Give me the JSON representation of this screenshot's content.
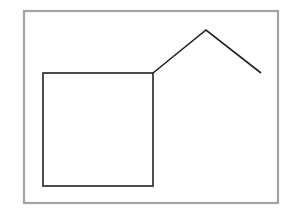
{
  "canvas": {
    "width": 292,
    "height": 215,
    "background_color": "#ffffff",
    "description": "Simple line drawing of a house: a square body with a peaked roof line extending to the upper right, enclosed in a thin gray rectangular frame"
  },
  "frame": {
    "label": "outer-frame",
    "stroke_color": "#a3a3a3",
    "stroke_width": 2.2,
    "fill": "none",
    "x": 24,
    "y": 11,
    "width": 254,
    "height": 192
  },
  "shapes": {
    "square": {
      "label": "square-body",
      "stroke_color": "#222222",
      "stroke_width": 1.6,
      "fill": "none",
      "x": 43,
      "y": 73,
      "width": 110,
      "height": 113,
      "corners": {
        "top_left": [
          43,
          73
        ],
        "top_right": [
          153,
          73
        ],
        "bottom_right": [
          153,
          186
        ],
        "bottom_left": [
          43,
          186
        ]
      }
    },
    "roof": {
      "label": "roof-peak-line",
      "stroke_color": "#222222",
      "stroke_width": 1.6,
      "fill": "none",
      "points": [
        [
          153,
          73
        ],
        [
          206,
          30
        ],
        [
          261,
          73
        ]
      ],
      "points_attr": "153,73 206,30 261,73",
      "apex": [
        206,
        30
      ]
    }
  }
}
